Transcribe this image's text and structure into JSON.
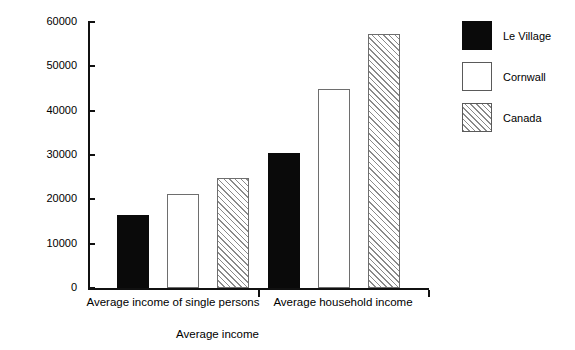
{
  "chart_data": {
    "type": "bar",
    "title": "",
    "xlabel": "Average income",
    "ylabel": "Income ($)",
    "categories": [
      "Average income of single persons",
      "Average household income"
    ],
    "series": [
      {
        "name": "Le Village",
        "values": [
          16500,
          30500
        ],
        "fill": "solid",
        "color": "#0a0a0a"
      },
      {
        "name": "Cornwall",
        "values": [
          21300,
          45000
        ],
        "fill": "open",
        "color": "#ffffff"
      },
      {
        "name": "Canada",
        "values": [
          24900,
          57400
        ],
        "fill": "hatch",
        "color": "#8a8a8a"
      }
    ],
    "ylim": [
      0,
      60000
    ],
    "ytick_labels": [
      "60000",
      "50000",
      "40000",
      "30000",
      "20000",
      "10000",
      "0"
    ],
    "ytick_values": [
      60000,
      50000,
      40000,
      30000,
      20000,
      10000,
      0
    ],
    "grid": false,
    "legend_position": "right"
  },
  "axis": {
    "y_title": "Income ($)",
    "x_title": "Average income"
  },
  "legend": {
    "items": [
      {
        "label": "Le Village"
      },
      {
        "label": "Cornwall"
      },
      {
        "label": "Canada"
      }
    ]
  }
}
